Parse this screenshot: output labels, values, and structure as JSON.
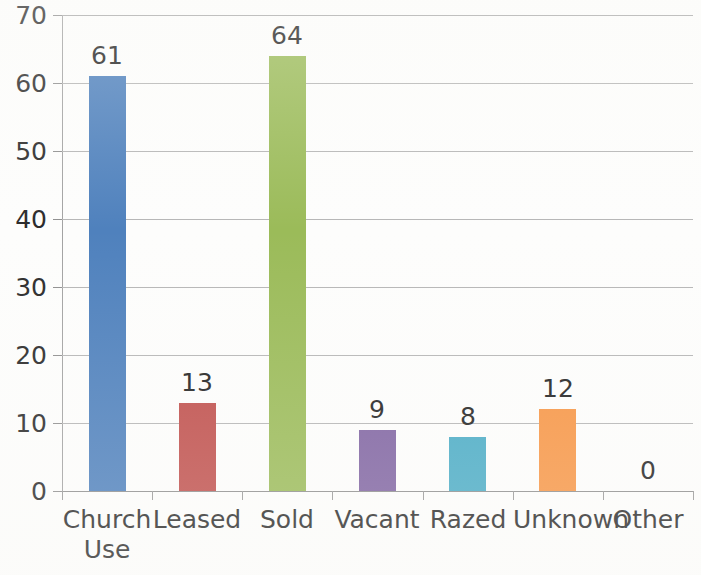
{
  "chart_data": {
    "type": "bar",
    "title": "",
    "xlabel": "",
    "ylabel": "",
    "categories": [
      "Church Use",
      "Leased",
      "Sold",
      "Vacant",
      "Razed",
      "Unknown",
      "Other"
    ],
    "values": [
      61,
      13,
      64,
      9,
      8,
      12,
      0
    ],
    "ylim": [
      0,
      70
    ],
    "y_ticks": [
      0,
      10,
      20,
      30,
      40,
      50,
      60,
      70
    ],
    "grid": true,
    "legend": "none",
    "data_labels": [
      "61",
      "13",
      "64",
      "9",
      "8",
      "12",
      "0"
    ],
    "bar_colors": [
      "#4F81BD",
      "#C0504D",
      "#9BBB59",
      "#8064A2",
      "#4BACC6",
      "#F79646",
      "#4F81BD"
    ]
  },
  "axis": {
    "y_tick_labels": [
      "70",
      "60",
      "50",
      "40",
      "30",
      "20",
      "10",
      "0"
    ],
    "x_tick_labels": [
      "Church\nUse",
      "Leased",
      "Sold",
      "Vacant",
      "Razed",
      "Unknown",
      "Other"
    ]
  },
  "colors": {
    "background": "#fdfdfc",
    "gridline": "#b6b6b6",
    "axis_line": "#8f8f8f",
    "text": "#2b2b2b"
  }
}
